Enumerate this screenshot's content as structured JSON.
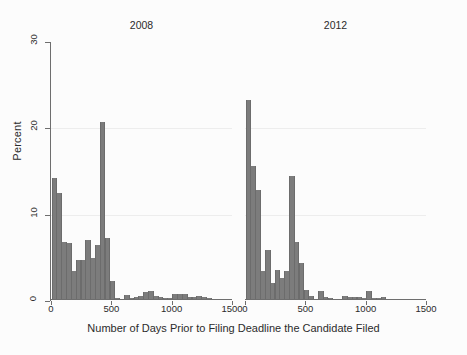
{
  "chart_data": {
    "type": "bar",
    "title": "",
    "xlabel": "Number of Days Prior to Filing Deadline the Candidate Filed",
    "ylabel": "Percent",
    "xlim": [
      0,
      1500
    ],
    "ylim": [
      0,
      30
    ],
    "xticks": [
      0,
      500,
      1000,
      1500
    ],
    "yticks": [
      0,
      10,
      20,
      30
    ],
    "grid": true,
    "bin_width": 40,
    "bar_color": "#7c7c7c",
    "panels": [
      {
        "label": "2008",
        "x": [
          20,
          60,
          100,
          140,
          180,
          220,
          260,
          300,
          340,
          380,
          420,
          460,
          500,
          540,
          580,
          620,
          660,
          700,
          740,
          780,
          820,
          860,
          900,
          940,
          980,
          1020,
          1060,
          1100,
          1140,
          1180,
          1220,
          1260,
          1300,
          1340,
          1380,
          1420,
          1460
        ],
        "values": [
          14.0,
          12.3,
          6.6,
          6.5,
          3.2,
          4.5,
          4.5,
          6.8,
          4.8,
          6.3,
          20.5,
          7.1,
          2.1,
          0.1,
          0.0,
          0.5,
          0.1,
          0.2,
          0.3,
          0.8,
          0.9,
          0.3,
          0.2,
          0.1,
          0.1,
          0.6,
          0.6,
          0.6,
          0.2,
          0.2,
          0.3,
          0.2,
          0.1,
          0.0,
          0.0,
          0.0,
          0.0
        ]
      },
      {
        "label": "2012",
        "x": [
          20,
          60,
          100,
          140,
          180,
          220,
          260,
          300,
          340,
          380,
          420,
          460,
          500,
          540,
          580,
          620,
          660,
          700,
          740,
          780,
          820,
          860,
          900,
          940,
          980,
          1020,
          1060,
          1100,
          1140,
          1180,
          1220,
          1260,
          1300,
          1340,
          1380,
          1420,
          1460
        ],
        "values": [
          23.0,
          15.4,
          12.6,
          3.3,
          5.7,
          1.9,
          3.4,
          2.4,
          3.3,
          14.2,
          6.6,
          4.2,
          1.0,
          0.3,
          0.0,
          0.9,
          0.2,
          0.1,
          0.0,
          0.0,
          0.4,
          0.2,
          0.2,
          0.2,
          0.1,
          0.9,
          0.1,
          0.1,
          0.2,
          0.0,
          0.0,
          0.0,
          0.0,
          0.0,
          0.0,
          0.0,
          0.0
        ]
      }
    ]
  }
}
